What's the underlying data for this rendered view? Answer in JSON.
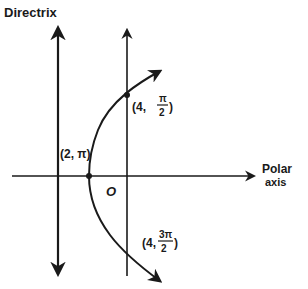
{
  "diagram": {
    "type": "polar-conic-parabola",
    "colors": {
      "ink": "#1a1a1a",
      "background": "#ffffff"
    },
    "labels": {
      "directrix": "Directrix",
      "polar_axis_line1": "Polar",
      "polar_axis_line2": "axis",
      "pole": "O",
      "point_vertex": "(2, π)",
      "point_top_prefix": "(4,",
      "point_top_num": "π",
      "point_top_den": "2",
      "point_top_suffix": ")",
      "point_bottom_prefix": "(4,",
      "point_bottom_num": "3π",
      "point_bottom_den": "2",
      "point_bottom_suffix": ")"
    },
    "points": [
      {
        "name": "vertex",
        "polar": "(2, π)"
      },
      {
        "name": "top",
        "polar": "(4, π/2)"
      },
      {
        "name": "bottom",
        "polar": "(4, 3π/2)"
      }
    ]
  }
}
